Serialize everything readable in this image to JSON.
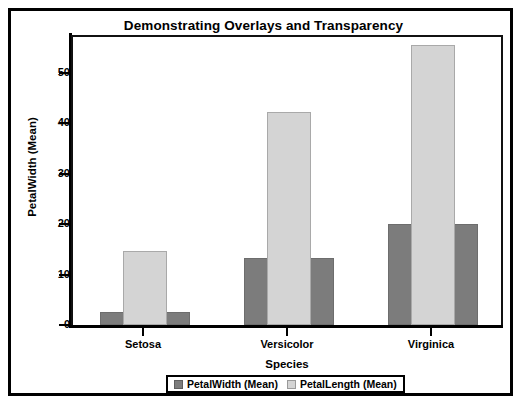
{
  "top_sliver_text": "",
  "chart_data": {
    "type": "bar",
    "title": "Demonstrating Overlays and Transparency",
    "subtitle": "",
    "xlabel": "Species",
    "ylabel": "PetalWidth (Mean)",
    "categories": [
      "Setosa",
      "Versicolor",
      "Virginica"
    ],
    "series": [
      {
        "name": "PetalWidth (Mean)",
        "color": "#7c7c7c",
        "values": [
          2.5,
          13.3,
          20.0
        ]
      },
      {
        "name": "PetalLength (Mean)",
        "color": "#d4d4d4",
        "values": [
          14.6,
          42.3,
          55.5
        ]
      }
    ],
    "ylim": [
      0,
      57.5
    ],
    "yticks": [
      0,
      10,
      20,
      30,
      40,
      50
    ],
    "ytick_labels": [
      "0",
      "10",
      "20",
      "30",
      "40",
      "50"
    ],
    "grid": false,
    "legend_position": "bottom",
    "overlay": "series drawn overlaid; PetalLength bars narrower and drawn on top of wider PetalWidth bars"
  },
  "legend": {
    "entries": [
      {
        "label": "PetalWidth (Mean)",
        "swatch": "dark-gray-swatch-icon"
      },
      {
        "label": "PetalLength (Mean)",
        "swatch": "light-gray-swatch-icon"
      }
    ]
  }
}
